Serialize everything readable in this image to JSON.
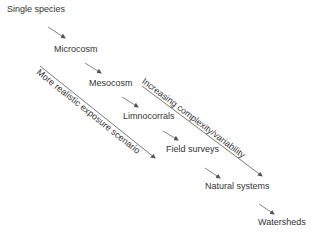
{
  "diagram": {
    "stages": [
      {
        "label": "Single species",
        "x": 7,
        "y": 4
      },
      {
        "label": "Microcosm",
        "x": 54,
        "y": 44
      },
      {
        "label": "Mesocosm",
        "x": 89,
        "y": 78
      },
      {
        "label": "Limnocorrals",
        "x": 123,
        "y": 111
      },
      {
        "label": "Field surveys",
        "x": 166,
        "y": 144
      },
      {
        "label": "Natural systems",
        "x": 205,
        "y": 181
      },
      {
        "label": "Watersheds",
        "x": 258,
        "y": 217
      }
    ],
    "axes": [
      {
        "label": "More realistic exposure scenario",
        "side": "left"
      },
      {
        "label": "Increasing complexity/variability",
        "side": "right"
      }
    ],
    "colors": {
      "line": "#555555",
      "text": "#333333",
      "background": "#ffffff"
    }
  }
}
